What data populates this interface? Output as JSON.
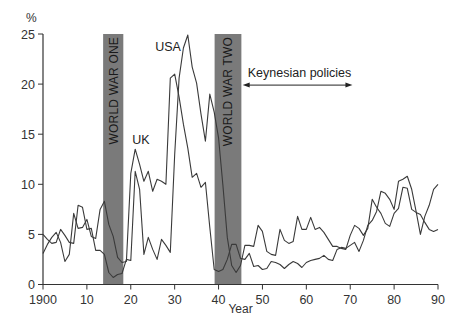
{
  "chart_data": {
    "type": "line",
    "title": "",
    "xlabel": "Year",
    "ylabel": "%",
    "xlim": [
      1900,
      1990
    ],
    "ylim": [
      0,
      25
    ],
    "grid": false,
    "x_ticks": [
      1900,
      1910,
      1920,
      1930,
      1940,
      1950,
      1960,
      1970,
      1980,
      1990
    ],
    "x_tick_labels": [
      "1900",
      "10",
      "20",
      "30",
      "40",
      "50",
      "60",
      "70",
      "80",
      "90"
    ],
    "y_ticks": [
      0,
      5,
      10,
      15,
      20,
      25
    ],
    "y_tick_labels": [
      "0",
      "5",
      "10",
      "15",
      "20",
      "25"
    ],
    "shaded_regions": [
      {
        "label": "WORLD WAR ONE",
        "x_start": 1913.7,
        "x_end": 1918.3,
        "color": "#7a7a7a"
      },
      {
        "label": "WORLD WAR TWO",
        "x_start": 1939.1,
        "x_end": 1945.2,
        "color": "#7a7a7a"
      }
    ],
    "annotations": [
      {
        "text": "USA",
        "x": 1928.5,
        "y": 23.3
      },
      {
        "text": "UK",
        "x": 1922.3,
        "y": 14.0
      },
      {
        "text": "Keynesian policies",
        "x_start": 1945.5,
        "x_end": 1970.5,
        "y": 20.0,
        "arrow": "double"
      }
    ],
    "series": [
      {
        "name": "UK",
        "x": [
          1900,
          1901,
          1902,
          1903,
          1904,
          1905,
          1906,
          1907,
          1908,
          1909,
          1910,
          1911,
          1912,
          1913,
          1914,
          1915,
          1916,
          1917,
          1918,
          1919,
          1920,
          1921,
          1922,
          1923,
          1924,
          1925,
          1926,
          1927,
          1928,
          1929,
          1930,
          1931,
          1932,
          1933,
          1934,
          1935,
          1936,
          1937,
          1938,
          1939,
          1940,
          1941,
          1942,
          1943,
          1944,
          1945,
          1946,
          1947,
          1948,
          1949,
          1950,
          1951,
          1952,
          1953,
          1954,
          1955,
          1956,
          1957,
          1958,
          1959,
          1960,
          1961,
          1962,
          1963,
          1964,
          1965,
          1966,
          1967,
          1968,
          1969,
          1970,
          1971,
          1972,
          1973,
          1974,
          1975,
          1976,
          1977,
          1978,
          1979,
          1980,
          1981,
          1982,
          1983,
          1984,
          1985,
          1986,
          1987,
          1988,
          1989,
          1990
        ],
        "values": [
          3.1,
          4.0,
          4.7,
          5.2,
          4.2,
          2.3,
          3.0,
          7.1,
          5.6,
          5.7,
          6.5,
          4.8,
          4.6,
          7.5,
          8.3,
          6.0,
          4.8,
          2.7,
          2.2,
          2.3,
          11.1,
          13.5,
          12.0,
          10.3,
          11.3,
          9.3,
          10.5,
          10.3,
          10.0,
          20.6,
          21.0,
          18.7,
          16.0,
          13.6,
          10.7,
          11.1,
          9.7,
          10.2,
          5.7,
          1.5,
          1.3,
          1.5,
          2.5,
          4.0,
          4.0,
          2.6,
          2.5,
          3.1,
          1.8,
          1.9,
          1.5,
          1.6,
          2.3,
          2.2,
          2.0,
          1.6,
          2.0,
          2.3,
          2.1,
          1.7,
          2.2,
          2.4,
          2.5,
          2.6,
          2.9,
          2.5,
          2.4,
          3.5,
          3.7,
          3.6,
          3.9,
          4.2,
          3.3,
          4.4,
          5.9,
          6.4,
          7.3,
          9.3,
          9.1,
          8.5,
          7.5,
          10.3,
          10.5,
          10.8,
          9.5,
          7.3,
          5.0,
          6.8,
          7.9,
          9.5,
          10.0
        ]
      },
      {
        "name": "USA",
        "x": [
          1900,
          1901,
          1902,
          1903,
          1904,
          1905,
          1906,
          1907,
          1908,
          1909,
          1910,
          1911,
          1912,
          1913,
          1914,
          1915,
          1916,
          1917,
          1918,
          1919,
          1920,
          1921,
          1922,
          1923,
          1924,
          1925,
          1926,
          1927,
          1928,
          1929,
          1930,
          1931,
          1932,
          1933,
          1934,
          1935,
          1936,
          1937,
          1938,
          1939,
          1940,
          1941,
          1942,
          1943,
          1944,
          1945,
          1946,
          1947,
          1948,
          1949,
          1950,
          1951,
          1952,
          1953,
          1954,
          1955,
          1956,
          1957,
          1958,
          1959,
          1960,
          1961,
          1962,
          1963,
          1964,
          1965,
          1966,
          1967,
          1968,
          1969,
          1970,
          1971,
          1972,
          1973,
          1974,
          1975,
          1976,
          1977,
          1978,
          1979,
          1980,
          1981,
          1982,
          1983,
          1984,
          1985,
          1986,
          1987,
          1988,
          1989,
          1990
        ],
        "values": [
          5.0,
          4.5,
          4.1,
          4.2,
          5.5,
          4.9,
          4.2,
          4.1,
          7.9,
          7.7,
          5.5,
          5.6,
          3.4,
          3.4,
          3.0,
          1.2,
          0.7,
          1.0,
          1.1,
          2.5,
          2.4,
          11.3,
          9.5,
          3.0,
          4.7,
          3.5,
          2.5,
          4.5,
          3.9,
          3.2,
          13.0,
          20.6,
          23.6,
          24.9,
          21.7,
          20.1,
          17.0,
          14.3,
          19.0,
          17.2,
          14.6,
          9.9,
          4.7,
          1.9,
          1.2,
          1.9,
          3.9,
          3.9,
          3.8,
          5.9,
          5.3,
          3.3,
          3.0,
          2.9,
          5.5,
          4.4,
          4.1,
          4.3,
          6.8,
          5.5,
          5.5,
          6.7,
          5.5,
          5.7,
          5.2,
          4.5,
          3.8,
          3.8,
          3.6,
          3.5,
          4.9,
          5.9,
          5.6,
          4.9,
          5.6,
          8.5,
          7.7,
          7.1,
          6.1,
          5.8,
          7.1,
          7.6,
          9.7,
          9.6,
          7.5,
          7.2,
          7.0,
          6.2,
          5.5,
          5.3,
          5.5
        ]
      }
    ]
  },
  "axes": {
    "y_unit_label": "%",
    "x_title": "Year"
  }
}
